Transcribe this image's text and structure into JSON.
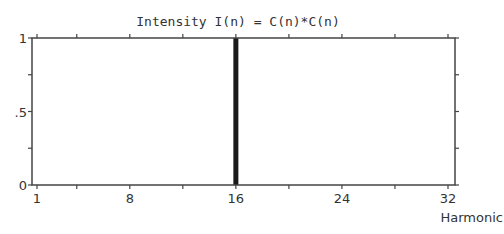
{
  "chart_data": {
    "type": "bar",
    "title": "Intensity I(n) = C(n)*C(n)",
    "xlabel": "Harmonic",
    "ylabel": "",
    "x_tick_labels": [
      "1",
      "8",
      "16",
      "24",
      "32"
    ],
    "x_tick_positions": [
      1,
      4,
      8,
      12,
      16,
      20,
      24,
      28,
      32
    ],
    "y_tick_labels": [
      "0",
      ".5",
      "1"
    ],
    "y_tick_positions": [
      0,
      0.25,
      0.5,
      0.75,
      1
    ],
    "xlim": [
      1,
      32
    ],
    "ylim": [
      0,
      1
    ],
    "grid": false,
    "x": [
      16
    ],
    "values": [
      1
    ],
    "bar_color": "#1a1a1a"
  }
}
